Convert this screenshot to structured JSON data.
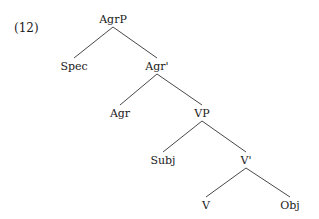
{
  "example_number": "(12)",
  "tree": {
    "nodes": [
      {
        "id": "agrp",
        "label": "AgrP",
        "x": 113,
        "y": 19
      },
      {
        "id": "spec",
        "label": "Spec",
        "x": 74,
        "y": 66
      },
      {
        "id": "agr-bar",
        "label": "Agr'",
        "x": 157,
        "y": 66
      },
      {
        "id": "agr",
        "label": "Agr",
        "x": 120,
        "y": 113
      },
      {
        "id": "vp",
        "label": "VP",
        "x": 202,
        "y": 113
      },
      {
        "id": "subj",
        "label": "Subj",
        "x": 163,
        "y": 160
      },
      {
        "id": "v-bar",
        "label": "V'",
        "x": 246,
        "y": 160
      },
      {
        "id": "v",
        "label": "V",
        "x": 206,
        "y": 205
      },
      {
        "id": "obj",
        "label": "Obj",
        "x": 290,
        "y": 205
      }
    ],
    "edges": [
      {
        "from": "agrp",
        "to": "spec"
      },
      {
        "from": "agrp",
        "to": "agr-bar"
      },
      {
        "from": "agr-bar",
        "to": "agr"
      },
      {
        "from": "agr-bar",
        "to": "vp"
      },
      {
        "from": "vp",
        "to": "subj"
      },
      {
        "from": "vp",
        "to": "v-bar"
      },
      {
        "from": "v-bar",
        "to": "v"
      },
      {
        "from": "v-bar",
        "to": "obj"
      }
    ]
  }
}
